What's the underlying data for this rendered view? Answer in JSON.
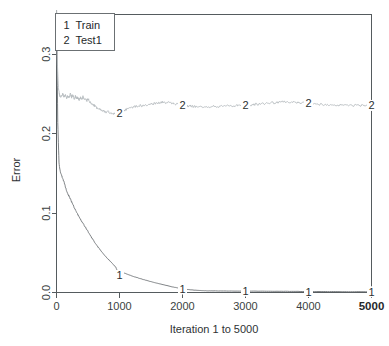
{
  "chart_data": {
    "type": "line",
    "title": "",
    "xlabel": "Iteration 1 to 5000",
    "ylabel": "Error",
    "xlim": [
      0,
      5000
    ],
    "ylim": [
      0.0,
      0.35
    ],
    "grid": false,
    "legend_position": "top-left",
    "x_ticks": [
      "0",
      "1000",
      "2000",
      "3000",
      "4000",
      "5000"
    ],
    "x_tick_values": [
      0,
      1000,
      2000,
      3000,
      4000,
      5000
    ],
    "x_tick_emphasis": [
      false,
      false,
      false,
      false,
      false,
      true
    ],
    "y_ticks": [
      "0.0",
      "0.1",
      "0.2",
      "0.3"
    ],
    "y_tick_values": [
      0.0,
      0.1,
      0.2,
      0.3
    ],
    "series": [
      {
        "name": "Train",
        "key": "1",
        "color": "#6e7376",
        "marker_label": "1",
        "marker_x": [
          1000,
          2000,
          3000,
          4000,
          5000
        ],
        "marker_y": [
          0.0215,
          0.0045,
          0.0018,
          0.0012,
          0.0009
        ],
        "x": [
          1,
          20,
          40,
          60,
          80,
          100,
          120,
          140,
          160,
          180,
          200,
          230,
          260,
          300,
          340,
          380,
          420,
          460,
          500,
          550,
          600,
          650,
          700,
          760,
          820,
          880,
          940,
          1000,
          1070,
          1140,
          1210,
          1290,
          1370,
          1450,
          1540,
          1630,
          1720,
          1820,
          1920,
          2000,
          2100,
          2200,
          2300,
          2400,
          2500,
          2650,
          2800,
          3000,
          3200,
          3400,
          3600,
          3800,
          4000,
          4200,
          4400,
          4600,
          4800,
          5000
        ],
        "y": [
          0.355,
          0.214,
          0.163,
          0.152,
          0.148,
          0.143,
          0.139,
          0.133,
          0.128,
          0.124,
          0.121,
          0.116,
          0.111,
          0.104,
          0.098,
          0.092,
          0.087,
          0.082,
          0.077,
          0.07,
          0.064,
          0.058,
          0.053,
          0.047,
          0.042,
          0.037,
          0.032,
          0.0215,
          0.0245,
          0.0225,
          0.0205,
          0.0185,
          0.0165,
          0.0148,
          0.0128,
          0.011,
          0.0094,
          0.0074,
          0.0058,
          0.0045,
          0.0036,
          0.0029,
          0.0024,
          0.0021,
          0.002,
          0.0019,
          0.0018,
          0.0018,
          0.0017,
          0.0016,
          0.0015,
          0.0014,
          0.0012,
          0.0012,
          0.0011,
          0.001,
          0.001,
          0.0009
        ]
      },
      {
        "name": "Test1",
        "key": "2",
        "color": "#b7bcbf",
        "marker_label": "2",
        "marker_x": [
          1000,
          2000,
          3000,
          4000,
          5000
        ],
        "marker_y": [
          0.2265,
          0.2355,
          0.2365,
          0.238,
          0.2355
        ],
        "x": [
          1,
          15,
          30,
          45,
          60,
          80,
          100,
          120,
          140,
          160,
          180,
          200,
          220,
          240,
          260,
          280,
          300,
          320,
          340,
          360,
          380,
          400,
          420,
          440,
          460,
          480,
          500,
          530,
          560,
          590,
          620,
          660,
          700,
          740,
          780,
          820,
          860,
          900,
          940,
          980,
          1000,
          1050,
          1100,
          1150,
          1200,
          1260,
          1320,
          1380,
          1440,
          1500,
          1560,
          1620,
          1680,
          1740,
          1800,
          1860,
          1920,
          1960,
          2000,
          2060,
          2120,
          2180,
          2250,
          2320,
          2400,
          2480,
          2560,
          2650,
          2750,
          2850,
          2930,
          3000,
          3080,
          3160,
          3250,
          3350,
          3450,
          3550,
          3650,
          3750,
          3850,
          3930,
          4000,
          4080,
          4160,
          4250,
          4350,
          4450,
          4550,
          4650,
          4750,
          4850,
          4950,
          5000
        ],
        "y": [
          0.355,
          0.286,
          0.258,
          0.25,
          0.2455,
          0.247,
          0.2505,
          0.2465,
          0.249,
          0.244,
          0.248,
          0.2445,
          0.25,
          0.246,
          0.249,
          0.2435,
          0.247,
          0.244,
          0.2455,
          0.242,
          0.2455,
          0.243,
          0.2465,
          0.2425,
          0.245,
          0.2415,
          0.244,
          0.24,
          0.2375,
          0.236,
          0.234,
          0.2315,
          0.23,
          0.2285,
          0.227,
          0.2275,
          0.226,
          0.2255,
          0.226,
          0.2255,
          0.2265,
          0.2285,
          0.23,
          0.232,
          0.233,
          0.234,
          0.2355,
          0.2345,
          0.236,
          0.2375,
          0.238,
          0.239,
          0.2395,
          0.2385,
          0.2395,
          0.238,
          0.237,
          0.236,
          0.2355,
          0.2345,
          0.235,
          0.234,
          0.2345,
          0.2335,
          0.234,
          0.2345,
          0.2335,
          0.2345,
          0.235,
          0.2355,
          0.236,
          0.2365,
          0.236,
          0.237,
          0.2375,
          0.2385,
          0.239,
          0.24,
          0.24,
          0.2395,
          0.239,
          0.2385,
          0.238,
          0.2375,
          0.237,
          0.2365,
          0.2365,
          0.236,
          0.236,
          0.2355,
          0.2355,
          0.236,
          0.2355,
          0.2355
        ]
      }
    ],
    "legend": {
      "entries": [
        {
          "key": "1",
          "label": "Train"
        },
        {
          "key": "2",
          "label": "Test1"
        }
      ]
    }
  }
}
